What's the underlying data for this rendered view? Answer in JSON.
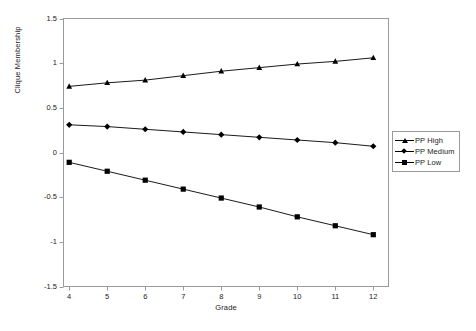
{
  "chart_data": {
    "type": "line",
    "title": "",
    "xlabel": "Grade",
    "ylabel": "Clique Membership",
    "x": [
      4,
      5,
      6,
      7,
      8,
      9,
      10,
      11,
      12
    ],
    "xticklabels": [
      "4",
      "5",
      "6",
      "7",
      "8",
      "9",
      "10",
      "11",
      "12"
    ],
    "yticklabels": [
      "1.5",
      "1",
      "0.5",
      "0",
      "-0.5",
      "-1",
      "-1.5"
    ],
    "ytickvalues": [
      1.5,
      1,
      0.5,
      0,
      -0.5,
      -1,
      -1.5
    ],
    "xlim": [
      3.85,
      12.4
    ],
    "ylim": [
      -1.5,
      1.5
    ],
    "grid": false,
    "legend_position": "right",
    "series": [
      {
        "name": "PP High",
        "marker": "triangle",
        "color": "#000000",
        "values": [
          0.74,
          0.78,
          0.81,
          0.86,
          0.91,
          0.95,
          0.99,
          1.02,
          1.06
        ]
      },
      {
        "name": "PP Medium",
        "marker": "diamond",
        "color": "#000000",
        "values": [
          0.31,
          0.29,
          0.26,
          0.23,
          0.2,
          0.17,
          0.14,
          0.11,
          0.07
        ]
      },
      {
        "name": "PP Low",
        "marker": "square",
        "color": "#000000",
        "values": [
          -0.11,
          -0.21,
          -0.31,
          -0.41,
          -0.51,
          -0.61,
          -0.72,
          -0.82,
          -0.92
        ]
      }
    ]
  },
  "legend": {
    "items": [
      {
        "label": "PP High"
      },
      {
        "label": "PP Medium"
      },
      {
        "label": "PP Low"
      }
    ]
  },
  "axes": {
    "x_title": "Grade",
    "y_title": "Clique Membership"
  }
}
